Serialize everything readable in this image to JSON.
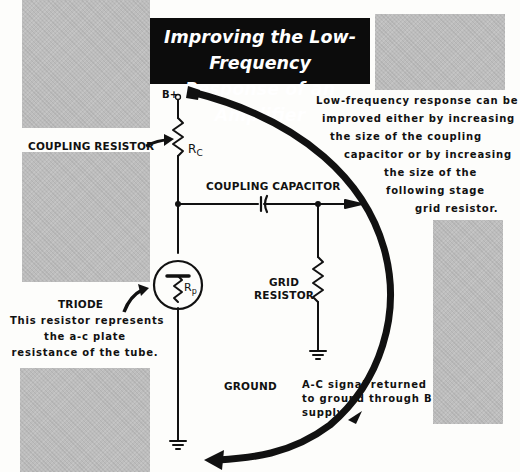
{
  "title": {
    "line1": "Improving the Low-Frequency",
    "line2": "Response of an Amplifier"
  },
  "circuit": {
    "supply_label": "B+",
    "coupling_resistor_symbol": "R",
    "coupling_resistor_subscript": "C",
    "plate_resistance_symbol": "R",
    "plate_resistance_subscript": "p"
  },
  "labels": {
    "coupling_resistor": "COUPLING RESISTOR",
    "coupling_capacitor": "COUPLING CAPACITOR",
    "grid_resistor_line1": "GRID",
    "grid_resistor_line2": "RESISTOR",
    "triode": "TRIODE",
    "ground": "GROUND"
  },
  "notes": {
    "triode_note": [
      "This resistor represents",
      "the a-c plate",
      "resistance of the tube."
    ],
    "low_freq_note": [
      "Low-frequency response can be",
      "improved either by increasing",
      "the size of the coupling",
      "capacitor or by increasing",
      "the size of the",
      "following  stage",
      "grid resistor."
    ],
    "return_note": [
      "A-C signal returned",
      "to ground through B",
      "supply"
    ]
  },
  "colors": {
    "ink": "#111111",
    "title_bg": "#0c0c0c",
    "title_text": "#ffffff",
    "halftone_gray": "#bdbdbd",
    "paper": "#fdfdfb"
  }
}
